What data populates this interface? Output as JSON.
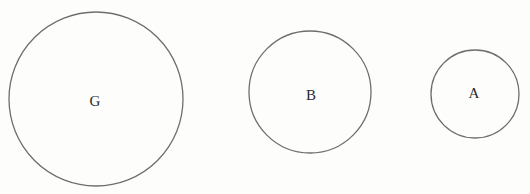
{
  "diagram": {
    "type": "labeled-circles",
    "circles": [
      {
        "id": "G",
        "label": "G",
        "cx": 96,
        "cy": 99,
        "r": 87,
        "label_x": 95,
        "label_y": 103
      },
      {
        "id": "B",
        "label": "B",
        "cx": 310,
        "cy": 92,
        "r": 61,
        "label_x": 311,
        "label_y": 97
      },
      {
        "id": "A",
        "label": "A",
        "cx": 475,
        "cy": 94,
        "r": 44,
        "label_x": 474,
        "label_y": 95
      }
    ],
    "colors": {
      "stroke": "#6e6e6e",
      "label": "#2a2a2a",
      "background": "#fdfdfc"
    }
  }
}
